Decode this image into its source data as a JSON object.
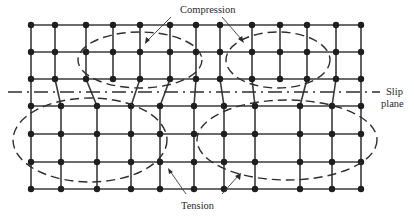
{
  "figure": {
    "type": "crystal-lattice-dislocation-diagram",
    "labels": {
      "compression": "Compression",
      "tension": "Tension",
      "slip_plane_line1": "Slip",
      "slip_plane_line2": "plane"
    },
    "colors": {
      "background": "#ffffff",
      "lines": "#3a3a3a",
      "nodes": "#1e1e1e"
    },
    "slip_plane_y": 92,
    "upper_rows": {
      "y": [
        25,
        52,
        79
      ],
      "node_x": [
        31,
        55,
        86,
        113,
        140,
        170,
        196,
        220,
        252,
        280,
        307,
        336,
        361
      ],
      "node_count_per_row": 13
    },
    "lower_rows": {
      "y": [
        106,
        134,
        162,
        189
      ],
      "node_x": [
        31,
        61,
        97,
        131,
        160,
        194,
        224,
        255,
        300,
        332,
        361
      ],
      "node_count_per_row": 11
    },
    "compression_zones": [
      {
        "cx": 140,
        "cy": 60,
        "rx": 62,
        "ry": 28
      },
      {
        "cx": 278,
        "cy": 60,
        "rx": 52,
        "ry": 28
      }
    ],
    "tension_zones": [
      {
        "cx": 90,
        "cy": 140,
        "rx": 77,
        "ry": 42
      },
      {
        "cx": 287,
        "cy": 140,
        "rx": 90,
        "ry": 40
      }
    ]
  }
}
